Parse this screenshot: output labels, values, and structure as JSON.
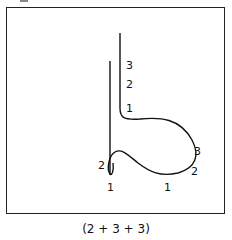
{
  "figure": {
    "caption": "(2 + 3 + 3)",
    "stroke_color": "#111111",
    "labels": {
      "stroke_a_3": "3",
      "stroke_a_2": "2",
      "stroke_a_1": "1",
      "loop_right_3": "3",
      "loop_right_2": "2",
      "bottom_right_1": "1",
      "bottom_left_1": "1",
      "left_loop_2": "2"
    }
  }
}
